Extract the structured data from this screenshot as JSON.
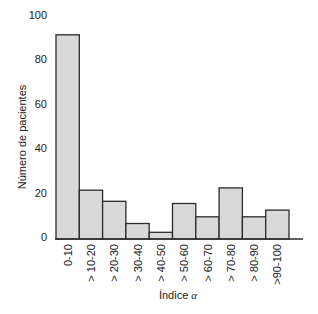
{
  "chart_data": {
    "type": "bar",
    "title": "",
    "xlabel": "Índice α",
    "ylabel": "Número de pacientes",
    "categories": [
      "0-10",
      "> 10-20",
      "> 20-30",
      "> 30-40",
      "> 40-50",
      "> 50-60",
      "> 60-70",
      "> 70-80",
      "> 80-90",
      ">90-100"
    ],
    "values": [
      92,
      22,
      17,
      7,
      3,
      16,
      10,
      23,
      10,
      13
    ],
    "ylim": [
      0,
      100
    ],
    "yticks": [
      0,
      20,
      40,
      60,
      80,
      100
    ],
    "grid": false,
    "legend": null,
    "bar_gap": 0
  },
  "colors": {
    "bar_fill": "#d9d9d9",
    "bar_stroke": "#2b2b2b",
    "text": "#222222"
  }
}
